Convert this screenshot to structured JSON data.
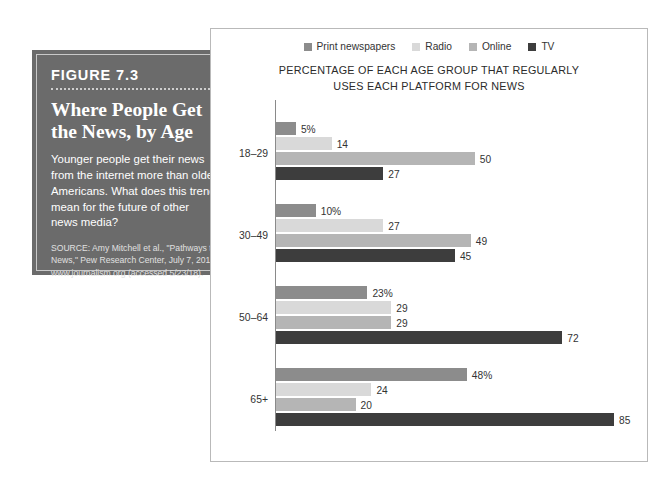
{
  "figure": {
    "number": "FIGURE 7.3",
    "title": "Where People Get the News, by Age",
    "description": "Younger people get their news from the internet more than older Americans. What does this trend mean for the future of other news media?",
    "source": "SOURCE: Amy Mitchell et al., \"Pathways to News,\" Pew Research Center, July 7, 2016, www.journalism.org (accessed 5/23/18)."
  },
  "chart_data": {
    "type": "bar",
    "orientation": "horizontal",
    "title_line1": "PERCENTAGE OF EACH AGE GROUP THAT REGULARLY",
    "title_line2": "USES EACH PLATFORM FOR NEWS",
    "xlabel": "",
    "ylabel": "",
    "xlim": [
      0,
      90
    ],
    "grid": false,
    "legend_position": "top",
    "categories": [
      "18–29",
      "30–49",
      "50–64",
      "65+"
    ],
    "series": [
      {
        "name": "Print newspapers",
        "color": "#8c8c8c",
        "values": [
          5,
          10,
          23,
          48
        ],
        "labels": [
          "5%",
          "10%",
          "23%",
          "48%"
        ]
      },
      {
        "name": "Radio",
        "color": "#d9d9d9",
        "values": [
          14,
          27,
          29,
          24
        ],
        "labels": [
          "14",
          "27",
          "29",
          "24"
        ]
      },
      {
        "name": "Online",
        "color": "#b5b5b5",
        "values": [
          50,
          49,
          29,
          20
        ],
        "labels": [
          "50",
          "49",
          "29",
          "20"
        ]
      },
      {
        "name": "TV",
        "color": "#3d3d3d",
        "values": [
          27,
          45,
          72,
          85
        ],
        "labels": [
          "27",
          "45",
          "72",
          "85"
        ]
      }
    ]
  }
}
